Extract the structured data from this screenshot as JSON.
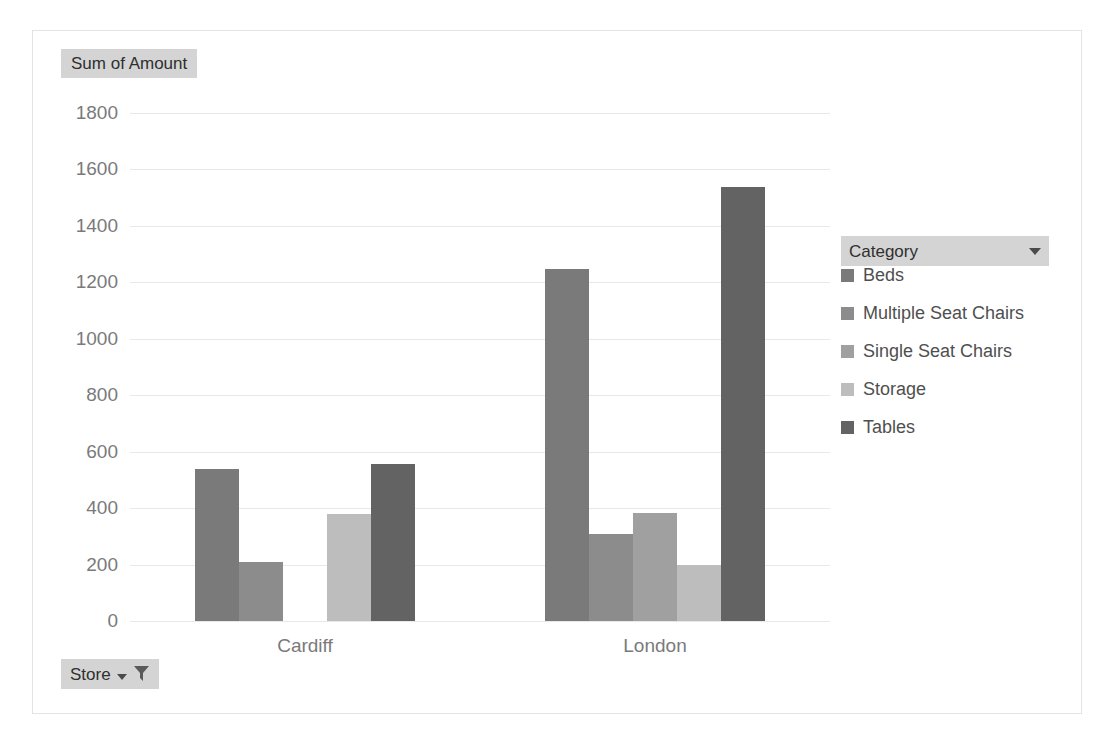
{
  "value_field": {
    "label": "Sum of Amount"
  },
  "store_field": {
    "label": "Store",
    "dropdown_icon": "chevron-down-icon",
    "filter_icon": "funnel-icon"
  },
  "legend": {
    "field_label": "Category",
    "dropdown_icon": "chevron-down-icon"
  },
  "chart_data": {
    "type": "bar",
    "title": "Sum of Amount",
    "xlabel": "",
    "ylabel": "",
    "categories": [
      "Cardiff",
      "London"
    ],
    "series": [
      {
        "name": "Beds",
        "color": "#7a7a7a",
        "values": [
          540,
          1248
        ]
      },
      {
        "name": "Multiple Seat Chairs",
        "color": "#8c8c8c",
        "values": [
          210,
          308
        ]
      },
      {
        "name": "Single Seat Chairs",
        "color": "#a0a0a0",
        "values": [
          0,
          382
        ]
      },
      {
        "name": "Storage",
        "color": "#bdbdbd",
        "values": [
          378,
          200
        ]
      },
      {
        "name": "Tables",
        "color": "#636363",
        "values": [
          555,
          1537
        ]
      }
    ],
    "ylim": [
      0,
      1800
    ],
    "ytick_step": 200,
    "yticks": [
      0,
      200,
      400,
      600,
      800,
      1000,
      1200,
      1400,
      1600,
      1800
    ],
    "grid": true,
    "legend_position": "right"
  }
}
